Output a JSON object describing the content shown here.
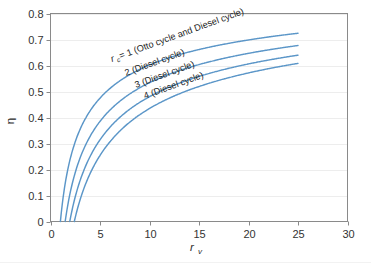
{
  "chart_data": {
    "type": "line",
    "title": "",
    "xlabel": "r_v",
    "ylabel": "eta",
    "xlabel_base": "r",
    "xlabel_subscript": "v",
    "ylabel_symbol": "η",
    "xlim": [
      0,
      30
    ],
    "ylim": [
      0,
      0.8
    ],
    "xticks": [
      0,
      5,
      10,
      15,
      20,
      25,
      30
    ],
    "xtick_labels": [
      "0",
      "5",
      "10",
      "15",
      "20",
      "25",
      "30"
    ],
    "yticks": [
      0,
      0.1,
      0.2,
      0.3,
      0.4,
      0.5,
      0.6,
      0.7,
      0.8
    ],
    "ytick_labels": [
      "0",
      "0.1",
      "0.2",
      "0.3",
      "0.4",
      "0.5",
      "0.6",
      "0.7",
      "0.8"
    ],
    "grid": "horizontal",
    "legend_position": "inline-annotations",
    "line_color": "#5b96c8",
    "gamma": 1.4,
    "series": [
      {
        "name": "rc = 1 (Otto cycle and Diesel cycle)",
        "rc": 1,
        "label_base": "r",
        "label_subscript": "c",
        "label_rest": " = 1 (Otto cycle and Diesel cycle)",
        "x": [
          1.0,
          1.3,
          1.6,
          2.0,
          2.5,
          3.0,
          3.5,
          4.0,
          5.0,
          6.0,
          7.0,
          8.0,
          9.0,
          10.0,
          11.0,
          12.0,
          13.0,
          14.0,
          15.0,
          16.0,
          17.0,
          18.0,
          19.0,
          20.0,
          21.0,
          22.0,
          23.0,
          24.0,
          25.0
        ],
        "y": [
          0.0,
          0.074,
          0.128,
          0.189,
          0.253,
          0.3,
          0.339,
          0.371,
          0.475,
          0.512,
          0.541,
          0.565,
          0.585,
          0.602,
          0.617,
          0.63,
          0.642,
          0.652,
          0.661,
          0.67,
          0.678,
          0.685,
          0.691,
          0.698,
          0.703,
          0.709,
          0.714,
          0.718,
          0.723
        ]
      },
      {
        "name": "2 (Diesel cycle)",
        "rc": 2,
        "label_rest": "2 (Diesel cycle)",
        "x": [
          1.7,
          2.0,
          2.5,
          3.0,
          3.5,
          4.0,
          5.0,
          6.0,
          7.0,
          8.0,
          9.0,
          10.0,
          11.0,
          12.0,
          13.0,
          14.0,
          15.0,
          16.0,
          17.0,
          18.0,
          19.0,
          20.0,
          21.0,
          22.0,
          23.0,
          24.0,
          25.0
        ],
        "y": [
          0.0,
          0.043,
          0.108,
          0.159,
          0.2,
          0.235,
          0.29,
          0.334,
          0.37,
          0.4,
          0.425,
          0.447,
          0.466,
          0.483,
          0.498,
          0.512,
          0.524,
          0.535,
          0.546,
          0.555,
          0.564,
          0.572,
          0.58,
          0.587,
          0.594,
          0.6,
          0.606
        ]
      },
      {
        "name": "3 (Diesel cycle)",
        "rc": 3,
        "label_rest": "3 (Diesel cycle)",
        "x": [
          2.2,
          2.5,
          3.0,
          3.5,
          4.0,
          5.0,
          6.0,
          7.0,
          8.0,
          9.0,
          10.0,
          11.0,
          12.0,
          13.0,
          14.0,
          15.0,
          16.0,
          17.0,
          18.0,
          19.0,
          20.0,
          21.0,
          22.0,
          23.0,
          24.0,
          25.0
        ],
        "y": [
          0.0,
          0.038,
          0.097,
          0.145,
          0.185,
          0.248,
          0.296,
          0.335,
          0.368,
          0.396,
          0.42,
          0.441,
          0.46,
          0.477,
          0.492,
          0.506,
          0.518,
          0.53,
          0.54,
          0.55,
          0.559,
          0.568,
          0.576,
          0.583,
          0.59,
          0.597
        ]
      },
      {
        "name": "4 (Diesel cycle)",
        "rc": 4,
        "label_rest": "4 (Diesel cycle)",
        "x": [
          2.7,
          3.0,
          3.5,
          4.0,
          5.0,
          6.0,
          7.0,
          8.0,
          9.0,
          10.0,
          11.0,
          12.0,
          13.0,
          14.0,
          15.0,
          16.0,
          17.0,
          18.0,
          19.0,
          20.0,
          21.0,
          22.0,
          23.0,
          24.0,
          25.0
        ],
        "y": [
          0.0,
          0.032,
          0.085,
          0.13,
          0.2,
          0.254,
          0.297,
          0.333,
          0.364,
          0.39,
          0.413,
          0.434,
          0.452,
          0.468,
          0.483,
          0.497,
          0.509,
          0.521,
          0.532,
          0.542,
          0.551,
          0.56,
          0.568,
          0.576,
          0.583
        ]
      }
    ],
    "annotations": [
      {
        "text": "r_c = 1 (Otto cycle and Diesel cycle)",
        "rotation": -20,
        "x_px": 112,
        "y_px": 62
      },
      {
        "text": "2 (Diesel cycle)",
        "rotation": -20,
        "x_px": 126,
        "y_px": 76
      },
      {
        "text": "3 (Diesel cycle)",
        "rotation": -20,
        "x_px": 136,
        "y_px": 88
      },
      {
        "text": "4 (Diesel cycle)",
        "rotation": -20,
        "x_px": 145,
        "y_px": 99
      }
    ]
  }
}
